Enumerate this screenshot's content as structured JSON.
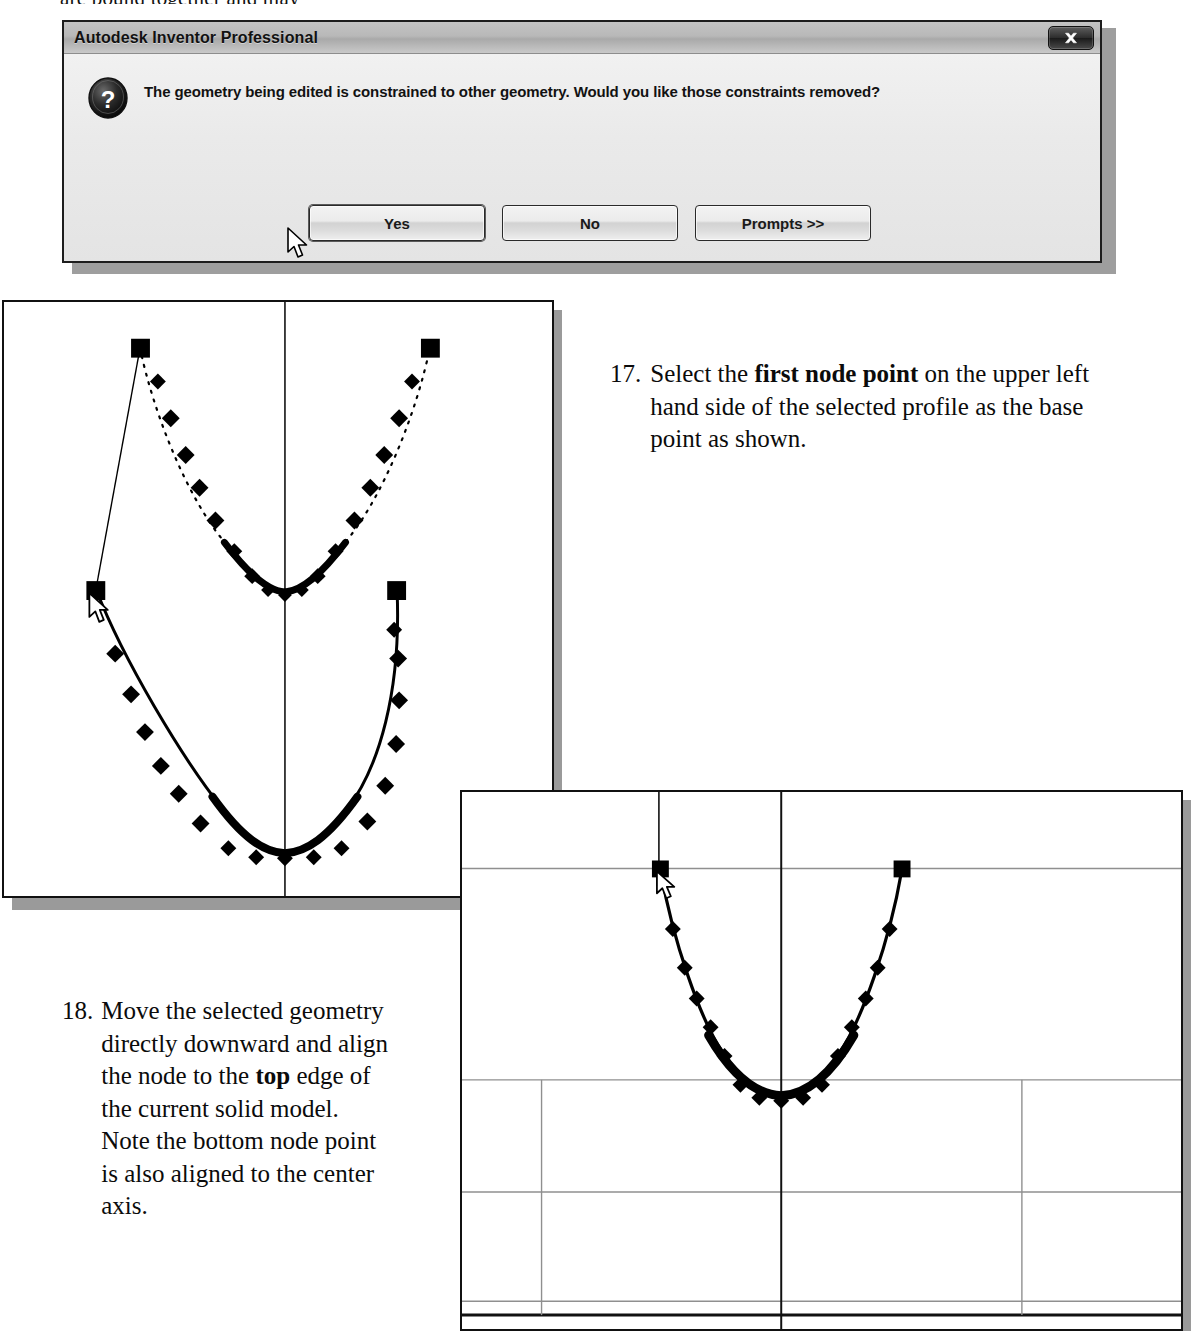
{
  "page": {
    "top_cut_text": "are bound together and may"
  },
  "dialog": {
    "title": "Autodesk Inventor Professional",
    "message": "The geometry being edited is constrained to other geometry. Would you like those constraints removed?",
    "icon": "question-icon",
    "close_icon": "close-icon",
    "buttons": [
      {
        "label": "Yes",
        "name": "yes-button",
        "default": true
      },
      {
        "label": "No",
        "name": "no-button",
        "default": false
      },
      {
        "label": "Prompts >>",
        "name": "prompts-button",
        "default": false
      }
    ],
    "cursor": "mouse-cursor"
  },
  "steps": [
    {
      "number": "17.",
      "text_before": "Select the ",
      "bold": "first node point",
      "text_after": " on the upper left hand side of the selected profile as the base point as shown."
    },
    {
      "number": "18.",
      "text_before": "Move the selected geometry directly downward and align the node to the ",
      "bold": "top",
      "text_after": " edge of the current solid model. Note the bottom node point is also aligned to the center axis."
    }
  ],
  "figures": [
    {
      "name": "sketch-profile-before-move",
      "caption": "",
      "has_center_axis": true,
      "cursor": "mouse-cursor",
      "colors": {
        "stroke": "#000000",
        "background": "#ffffff",
        "frame": "#111111"
      }
    },
    {
      "name": "sketch-profile-after-move",
      "caption": "",
      "has_center_axis": true,
      "has_grid": true,
      "cursor": "mouse-cursor",
      "colors": {
        "stroke": "#000000",
        "grid": "#8a8a8a",
        "background": "#ffffff",
        "frame": "#111111"
      }
    }
  ]
}
